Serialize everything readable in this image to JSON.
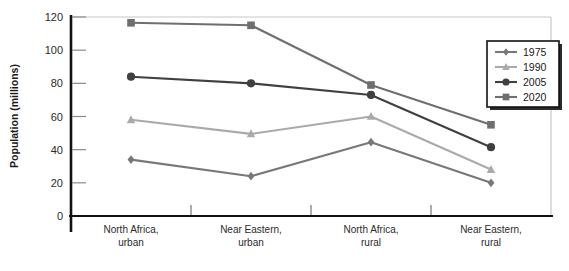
{
  "chart_data": {
    "type": "line",
    "title": "",
    "subtitle": "",
    "xlabel": "",
    "ylabel": "Population (millions)",
    "categories": [
      "North Africa,\nurban",
      "Near Eastern,\nurban",
      "North Africa,\nrural",
      "Near Eastern,\nrural"
    ],
    "category_lines": [
      [
        "North Africa,",
        "urban"
      ],
      [
        "Near Eastern,",
        "urban"
      ],
      [
        "North Africa,",
        "rural"
      ],
      [
        "Near Eastern,",
        "rural"
      ]
    ],
    "ylim": [
      0,
      120
    ],
    "yticks": [
      0,
      20,
      40,
      60,
      80,
      100,
      120
    ],
    "ytick_labels": [
      "0",
      "20",
      "40",
      "60",
      "80",
      "100",
      "120"
    ],
    "grid": false,
    "legend_position": "top-right",
    "series": [
      {
        "name": "1975",
        "marker": "diamond",
        "color": "#77787a",
        "values": [
          34,
          24,
          44.5,
          20
        ]
      },
      {
        "name": "1990",
        "marker": "triangle",
        "color": "#a9aaac",
        "values": [
          58,
          49.5,
          60,
          28
        ]
      },
      {
        "name": "2005",
        "marker": "circle",
        "color": "#3f4042",
        "values": [
          84,
          80,
          73,
          41.5
        ]
      },
      {
        "name": "2020",
        "marker": "square",
        "color": "#6e6f71",
        "values": [
          116.5,
          115,
          79,
          55
        ]
      }
    ]
  },
  "legend": {
    "entries": [
      {
        "label": "1975"
      },
      {
        "label": "1990"
      },
      {
        "label": "2005"
      },
      {
        "label": "2020"
      }
    ]
  },
  "axes": {
    "y_title": "Population (millions)"
  },
  "colors": {
    "axis": "#111111",
    "frame": "#c8c8c8",
    "tick": "#8a8a8a",
    "legend_border": "#111111",
    "legend_shadow": "#2b2b2b",
    "text": "#1a1a1a"
  }
}
